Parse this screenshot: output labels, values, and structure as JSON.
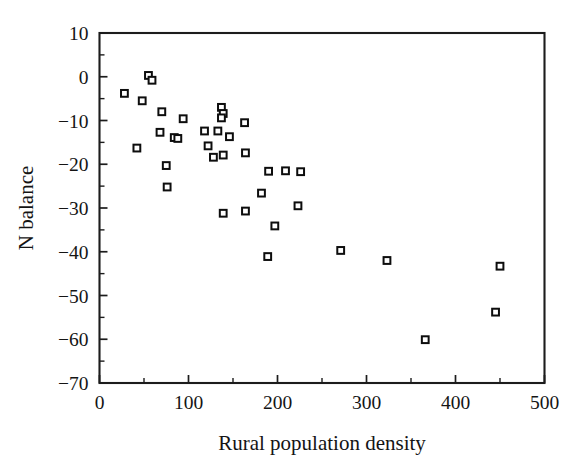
{
  "figure": {
    "background_color": "#ffffff",
    "frame_color": "#1c1c1c",
    "marker_edge_color": "#0d0d0d",
    "marker_face_color": "#ffffff"
  },
  "axes": {
    "x_title": "Rural population density",
    "y_title": "N balance",
    "x_ticklabels": [
      "0",
      "100",
      "200",
      "300",
      "400",
      "500"
    ],
    "y_ticklabels": [
      "10",
      "0",
      "-10",
      "-20",
      "-30",
      "-40",
      "-50",
      "-60",
      "-70"
    ]
  },
  "chart_data": {
    "type": "scatter",
    "title": "",
    "xlabel": "Rural population density",
    "ylabel": "N balance",
    "xlim": [
      0,
      500
    ],
    "ylim": [
      -70,
      10
    ],
    "xticks": [
      0,
      100,
      200,
      300,
      400,
      500
    ],
    "yticks": [
      10,
      0,
      -10,
      -20,
      -30,
      -40,
      -50,
      -60,
      -70
    ],
    "x_minor_tick_interval": 50,
    "y_minor_tick_interval": 5,
    "grid": false,
    "legend": null,
    "marker": "open-square",
    "series": [
      {
        "name": "N balance vs rural population density",
        "points": [
          [
            55,
            0.3
          ],
          [
            59,
            -0.8
          ],
          [
            28,
            -3.8
          ],
          [
            48,
            -5.5
          ],
          [
            70,
            -8.0
          ],
          [
            94,
            -9.6
          ],
          [
            137,
            -7.0
          ],
          [
            139,
            -8.4
          ],
          [
            137,
            -9.4
          ],
          [
            68,
            -12.7
          ],
          [
            84,
            -13.9
          ],
          [
            88,
            -14.1
          ],
          [
            118,
            -12.4
          ],
          [
            133,
            -12.4
          ],
          [
            146,
            -13.7
          ],
          [
            42,
            -16.3
          ],
          [
            75,
            -20.3
          ],
          [
            76,
            -25.2
          ],
          [
            163,
            -10.5
          ],
          [
            139,
            -17.9
          ],
          [
            164,
            -17.4
          ],
          [
            122,
            -15.8
          ],
          [
            128,
            -18.4
          ],
          [
            190,
            -21.6
          ],
          [
            209,
            -21.5
          ],
          [
            226,
            -21.7
          ],
          [
            182,
            -26.6
          ],
          [
            223,
            -29.5
          ],
          [
            139,
            -31.2
          ],
          [
            164,
            -30.7
          ],
          [
            197,
            -34.1
          ],
          [
            189,
            -41.1
          ],
          [
            271,
            -39.7
          ],
          [
            323,
            -42.0
          ],
          [
            450,
            -43.3
          ],
          [
            445,
            -53.8
          ],
          [
            366,
            -60.1
          ]
        ]
      }
    ]
  }
}
